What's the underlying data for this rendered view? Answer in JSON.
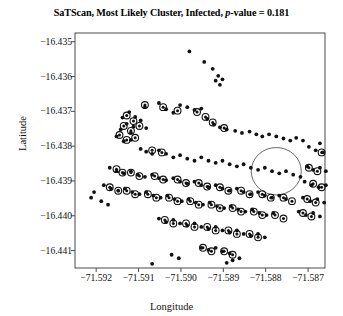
{
  "chart_data": {
    "type": "scatter",
    "title": "SaTScan, Most Likely Cluster, Infected, p-value = 0.181",
    "title_prefix": "SaTScan, Most Likely Cluster, Infected, ",
    "title_italic": "p",
    "title_suffix": "-value = 0.181",
    "p_value": 0.181,
    "xlabel": "Longitude",
    "ylabel": "Latitude",
    "xlim": [
      -71.5925,
      -71.5866
    ],
    "ylim": [
      -16.4415,
      -16.43475
    ],
    "grid": false,
    "legend": null,
    "xticks": [
      -71.592,
      -71.591,
      -71.59,
      -71.589,
      -71.588,
      -71.587
    ],
    "xtick_labels": [
      "−71.592",
      "−71.591",
      "−71.590",
      "−71.589",
      "−71.588",
      "−71.587"
    ],
    "yticks": [
      -16.435,
      -16.436,
      -16.437,
      -16.438,
      -16.439,
      -16.44,
      -16.441
    ],
    "ytick_labels": [
      "−16.435",
      "−16.436",
      "−16.437",
      "−16.438",
      "−16.439",
      "−16.440",
      "−16.441"
    ],
    "marker_color": "#111111",
    "ring_color": "#111111",
    "circle_color": "#555555",
    "cluster_circle": {
      "center_x": -71.58775,
      "center_y": -16.43872,
      "radius_x": 0.00059,
      "radius_y": 0.00068,
      "label": "most-likely-cluster"
    },
    "series": [
      {
        "name": "household",
        "marker": "dot",
        "points": [
          [
            -71.5898,
            -16.43528
          ],
          [
            -71.58945,
            -16.43558
          ],
          [
            -71.58925,
            -16.43578
          ],
          [
            -71.58912,
            -16.43598
          ],
          [
            -71.58918,
            -16.43612
          ],
          [
            -71.58902,
            -16.43608
          ],
          [
            -71.58908,
            -16.43624
          ],
          [
            -71.59085,
            -16.43688
          ],
          [
            -71.59052,
            -16.43676
          ],
          [
            -71.59035,
            -16.43694
          ],
          [
            -71.59018,
            -16.43704
          ],
          [
            -71.59002,
            -16.43682
          ],
          [
            -71.58985,
            -16.43688
          ],
          [
            -71.58968,
            -16.43696
          ],
          [
            -71.58952,
            -16.43692
          ],
          [
            -71.59122,
            -16.43702
          ],
          [
            -71.59108,
            -16.43716
          ],
          [
            -71.59095,
            -16.43726
          ],
          [
            -71.59138,
            -16.43718
          ],
          [
            -71.59128,
            -16.43736
          ],
          [
            -71.59112,
            -16.43744
          ],
          [
            -71.59142,
            -16.43752
          ],
          [
            -71.59118,
            -16.43762
          ],
          [
            -71.59082,
            -16.43748
          ],
          [
            -71.58938,
            -16.43722
          ],
          [
            -71.58922,
            -16.43738
          ],
          [
            -71.58908,
            -16.43746
          ],
          [
            -71.58892,
            -16.43752
          ],
          [
            -71.59152,
            -16.43772
          ],
          [
            -71.59135,
            -16.43786
          ],
          [
            -71.59118,
            -16.43782
          ],
          [
            -71.58872,
            -16.43756
          ],
          [
            -71.58856,
            -16.43762
          ],
          [
            -71.58838,
            -16.43758
          ],
          [
            -71.58822,
            -16.43766
          ],
          [
            -71.58808,
            -16.43772
          ],
          [
            -71.58792,
            -16.43766
          ],
          [
            -71.58775,
            -16.43772
          ],
          [
            -71.58758,
            -16.43778
          ],
          [
            -71.58742,
            -16.43784
          ],
          [
            -71.58728,
            -16.43776
          ],
          [
            -71.58712,
            -16.43784
          ],
          [
            -71.59095,
            -16.43808
          ],
          [
            -71.59082,
            -16.43816
          ],
          [
            -71.59068,
            -16.43822
          ],
          [
            -71.59052,
            -16.43812
          ],
          [
            -71.59035,
            -16.43822
          ],
          [
            -71.59018,
            -16.43832
          ],
          [
            -71.59002,
            -16.43826
          ],
          [
            -71.58985,
            -16.43836
          ],
          [
            -71.58968,
            -16.43842
          ],
          [
            -71.58952,
            -16.43832
          ],
          [
            -71.58935,
            -16.43842
          ],
          [
            -71.58918,
            -16.43848
          ],
          [
            -71.58902,
            -16.43842
          ],
          [
            -71.58885,
            -16.43852
          ],
          [
            -71.58868,
            -16.43858
          ],
          [
            -71.58852,
            -16.43852
          ],
          [
            -71.58835,
            -16.43862
          ],
          [
            -71.58818,
            -16.43868
          ],
          [
            -71.58802,
            -16.43862
          ],
          [
            -71.58785,
            -16.43872
          ],
          [
            -71.58768,
            -16.43878
          ],
          [
            -71.58752,
            -16.43872
          ],
          [
            -71.58735,
            -16.43882
          ],
          [
            -71.58718,
            -16.43888
          ],
          [
            -71.59168,
            -16.43862
          ],
          [
            -71.59152,
            -16.43872
          ],
          [
            -71.59135,
            -16.43878
          ],
          [
            -71.59118,
            -16.43872
          ],
          [
            -71.59102,
            -16.43882
          ],
          [
            -71.59085,
            -16.43888
          ],
          [
            -71.59068,
            -16.43882
          ],
          [
            -71.59052,
            -16.43892
          ],
          [
            -71.59035,
            -16.43898
          ],
          [
            -71.59018,
            -16.43892
          ],
          [
            -71.59002,
            -16.43902
          ],
          [
            -71.58985,
            -16.43908
          ],
          [
            -71.58968,
            -16.43902
          ],
          [
            -71.58952,
            -16.43912
          ],
          [
            -71.58935,
            -16.43918
          ],
          [
            -71.58918,
            -16.43912
          ],
          [
            -71.58902,
            -16.43922
          ],
          [
            -71.58885,
            -16.43928
          ],
          [
            -71.58868,
            -16.43922
          ],
          [
            -71.58852,
            -16.43932
          ],
          [
            -71.58835,
            -16.43938
          ],
          [
            -71.58818,
            -16.43932
          ],
          [
            -71.58802,
            -16.43942
          ],
          [
            -71.58785,
            -16.43948
          ],
          [
            -71.58768,
            -16.43942
          ],
          [
            -71.58752,
            -16.43952
          ],
          [
            -71.59182,
            -16.43912
          ],
          [
            -71.59165,
            -16.43922
          ],
          [
            -71.59148,
            -16.43928
          ],
          [
            -71.59132,
            -16.43922
          ],
          [
            -71.59115,
            -16.43932
          ],
          [
            -71.59098,
            -16.43938
          ],
          [
            -71.59082,
            -16.43932
          ],
          [
            -71.59065,
            -16.43942
          ],
          [
            -71.59048,
            -16.43948
          ],
          [
            -71.59032,
            -16.43942
          ],
          [
            -71.59015,
            -16.43952
          ],
          [
            -71.58998,
            -16.43958
          ],
          [
            -71.58982,
            -16.43952
          ],
          [
            -71.58965,
            -16.43962
          ],
          [
            -71.58948,
            -16.43968
          ],
          [
            -71.58932,
            -16.43962
          ],
          [
            -71.58915,
            -16.43972
          ],
          [
            -71.58898,
            -16.43978
          ],
          [
            -71.58882,
            -16.43972
          ],
          [
            -71.58865,
            -16.43982
          ],
          [
            -71.58848,
            -16.43988
          ],
          [
            -71.58832,
            -16.43982
          ],
          [
            -71.58815,
            -16.43992
          ],
          [
            -71.58798,
            -16.43998
          ],
          [
            -71.58782,
            -16.43992
          ],
          [
            -71.59052,
            -16.44008
          ],
          [
            -71.59035,
            -16.44018
          ],
          [
            -71.59018,
            -16.44012
          ],
          [
            -71.59002,
            -16.44022
          ],
          [
            -71.58985,
            -16.44028
          ],
          [
            -71.58968,
            -16.44022
          ],
          [
            -71.58952,
            -16.44032
          ],
          [
            -71.58935,
            -16.44038
          ],
          [
            -71.58918,
            -16.44032
          ],
          [
            -71.58902,
            -16.44042
          ],
          [
            -71.58885,
            -16.44048
          ],
          [
            -71.58868,
            -16.44042
          ],
          [
            -71.58852,
            -16.44052
          ],
          [
            -71.58835,
            -16.44058
          ],
          [
            -71.58818,
            -16.44052
          ],
          [
            -71.58802,
            -16.44062
          ],
          [
            -71.58952,
            -16.44092
          ],
          [
            -71.58935,
            -16.44098
          ],
          [
            -71.58918,
            -16.44092
          ],
          [
            -71.58902,
            -16.44102
          ],
          [
            -71.58885,
            -16.44108
          ],
          [
            -71.59022,
            -16.44112
          ],
          [
            -71.59005,
            -16.44122
          ],
          [
            -71.58892,
            -16.44135
          ],
          [
            -71.58878,
            -16.44128
          ],
          [
            -71.58862,
            -16.44122
          ],
          [
            -71.59068,
            -16.44138
          ],
          [
            -71.58672,
            -16.43792
          ],
          [
            -71.58655,
            -16.43782
          ],
          [
            -71.58638,
            -16.43788
          ],
          [
            -71.58698,
            -16.43802
          ],
          [
            -71.58682,
            -16.43812
          ],
          [
            -71.58665,
            -16.43818
          ],
          [
            -71.58648,
            -16.43812
          ],
          [
            -71.58702,
            -16.43858
          ],
          [
            -71.58688,
            -16.43868
          ],
          [
            -71.58672,
            -16.43862
          ],
          [
            -71.58658,
            -16.43872
          ],
          [
            -71.58642,
            -16.43878
          ],
          [
            -71.58708,
            -16.43902
          ],
          [
            -71.58692,
            -16.43912
          ],
          [
            -71.58675,
            -16.43918
          ],
          [
            -71.58658,
            -16.43912
          ],
          [
            -71.58642,
            -16.43922
          ],
          [
            -71.58625,
            -16.43928
          ],
          [
            -71.58712,
            -16.43948
          ],
          [
            -71.58695,
            -16.43958
          ],
          [
            -71.58678,
            -16.43952
          ],
          [
            -71.58662,
            -16.43962
          ],
          [
            -71.58645,
            -16.43968
          ],
          [
            -71.58722,
            -16.43988
          ],
          [
            -71.58705,
            -16.43998
          ],
          [
            -71.58688,
            -16.43992
          ],
          [
            -71.58672,
            -16.44002
          ],
          [
            -71.58655,
            -16.44008
          ],
          [
            -71.59188,
            -16.43958
          ],
          [
            -71.59172,
            -16.43968
          ],
          [
            -71.59205,
            -16.43932
          ],
          [
            -71.59212,
            -16.43948
          ]
        ]
      },
      {
        "name": "infected",
        "marker": "ringed-dot",
        "points": [
          [
            -71.59085,
            -16.43682
          ],
          [
            -71.59042,
            -16.43688
          ],
          [
            -71.59008,
            -16.43698
          ],
          [
            -71.58962,
            -16.43702
          ],
          [
            -71.59128,
            -16.43712
          ],
          [
            -71.59112,
            -16.43728
          ],
          [
            -71.59135,
            -16.43742
          ],
          [
            -71.59118,
            -16.43756
          ],
          [
            -71.59098,
            -16.43742
          ],
          [
            -71.58942,
            -16.43716
          ],
          [
            -71.58925,
            -16.43732
          ],
          [
            -71.58898,
            -16.43748
          ],
          [
            -71.59145,
            -16.43768
          ],
          [
            -71.59128,
            -16.43782
          ],
          [
            -71.59108,
            -16.43776
          ],
          [
            -71.59068,
            -16.43812
          ],
          [
            -71.59045,
            -16.43818
          ],
          [
            -71.59152,
            -16.43866
          ],
          [
            -71.59138,
            -16.43876
          ],
          [
            -71.59118,
            -16.43876
          ],
          [
            -71.59098,
            -16.43886
          ],
          [
            -71.59062,
            -16.43886
          ],
          [
            -71.59042,
            -16.43896
          ],
          [
            -71.59008,
            -16.43896
          ],
          [
            -71.58988,
            -16.43906
          ],
          [
            -71.58958,
            -16.43906
          ],
          [
            -71.58938,
            -16.43916
          ],
          [
            -71.58908,
            -16.43918
          ],
          [
            -71.58888,
            -16.43928
          ],
          [
            -71.58858,
            -16.43928
          ],
          [
            -71.58838,
            -16.43938
          ],
          [
            -71.58808,
            -16.43938
          ],
          [
            -71.58788,
            -16.43948
          ],
          [
            -71.58758,
            -16.43948
          ],
          [
            -71.58738,
            -16.43958
          ],
          [
            -71.58175,
            -16.43918
          ],
          [
            -71.59168,
            -16.43918
          ],
          [
            -71.59148,
            -16.43928
          ],
          [
            -71.59128,
            -16.43928
          ],
          [
            -71.59108,
            -16.43938
          ],
          [
            -71.59078,
            -16.43938
          ],
          [
            -71.59058,
            -16.43948
          ],
          [
            -71.59028,
            -16.43948
          ],
          [
            -71.59008,
            -16.43958
          ],
          [
            -71.58978,
            -16.43958
          ],
          [
            -71.58958,
            -16.43968
          ],
          [
            -71.58928,
            -16.43968
          ],
          [
            -71.58908,
            -16.43978
          ],
          [
            -71.58878,
            -16.43978
          ],
          [
            -71.58858,
            -16.43988
          ],
          [
            -71.58828,
            -16.43988
          ],
          [
            -71.58808,
            -16.43998
          ],
          [
            -71.58778,
            -16.43998
          ],
          [
            -71.58758,
            -16.44008
          ],
          [
            -71.59038,
            -16.44012
          ],
          [
            -71.59018,
            -16.44022
          ],
          [
            -71.58988,
            -16.44022
          ],
          [
            -71.58968,
            -16.44032
          ],
          [
            -71.58938,
            -16.44032
          ],
          [
            -71.58918,
            -16.44042
          ],
          [
            -71.58888,
            -16.44042
          ],
          [
            -71.58868,
            -16.44052
          ],
          [
            -71.58838,
            -16.44052
          ],
          [
            -71.58818,
            -16.44062
          ],
          [
            -71.58948,
            -16.44092
          ],
          [
            -71.58928,
            -16.44102
          ],
          [
            -71.58898,
            -16.44102
          ],
          [
            -71.58878,
            -16.44112
          ],
          [
            -71.58698,
            -16.43862
          ],
          [
            -71.58678,
            -16.43872
          ],
          [
            -71.58688,
            -16.43908
          ],
          [
            -71.58668,
            -16.43918
          ],
          [
            -71.58702,
            -16.43952
          ],
          [
            -71.58682,
            -16.43962
          ],
          [
            -71.58712,
            -16.43992
          ],
          [
            -71.58692,
            -16.44002
          ],
          [
            -71.58652,
            -16.43788
          ],
          [
            -71.58668,
            -16.43818
          ],
          [
            -71.58632,
            -16.43928
          ],
          [
            -71.58648,
            -16.43968
          ]
        ]
      }
    ]
  }
}
